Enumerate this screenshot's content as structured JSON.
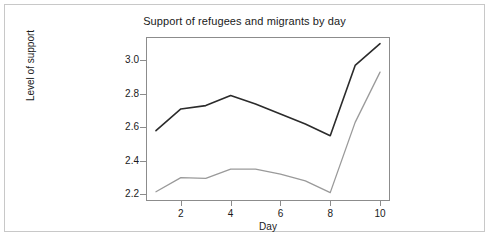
{
  "figure": {
    "border_color": "#c8c8c8",
    "background": "#ffffff"
  },
  "chart_data": {
    "type": "line",
    "title": "Support of refugees and migrants by day",
    "xlabel": "Day",
    "ylabel": "Level of support",
    "x": [
      1,
      2,
      3,
      4,
      5,
      6,
      7,
      8,
      9,
      10
    ],
    "xlim": [
      0.6,
      10.4
    ],
    "ylim": [
      2.16,
      3.14
    ],
    "xticks": [
      2,
      4,
      6,
      8,
      10
    ],
    "xtick_labels": [
      "2",
      "4",
      "6",
      "8",
      "10"
    ],
    "yticks": [
      2.2,
      2.4,
      2.6,
      2.8,
      3.0
    ],
    "ytick_labels": [
      "2.2",
      "2.4",
      "2.6",
      "2.8",
      "3.0"
    ],
    "grid": false,
    "legend": "none",
    "series": [
      {
        "name": "upper-series",
        "color": "#2b2b2b",
        "width": 1.6,
        "values": [
          2.58,
          2.71,
          2.73,
          2.79,
          2.74,
          2.68,
          2.62,
          2.55,
          2.97,
          3.1
        ]
      },
      {
        "name": "lower-series",
        "color": "#9a9a9a",
        "width": 1.3,
        "values": [
          2.215,
          2.3,
          2.295,
          2.35,
          2.35,
          2.32,
          2.28,
          2.21,
          2.63,
          2.93
        ]
      }
    ]
  }
}
